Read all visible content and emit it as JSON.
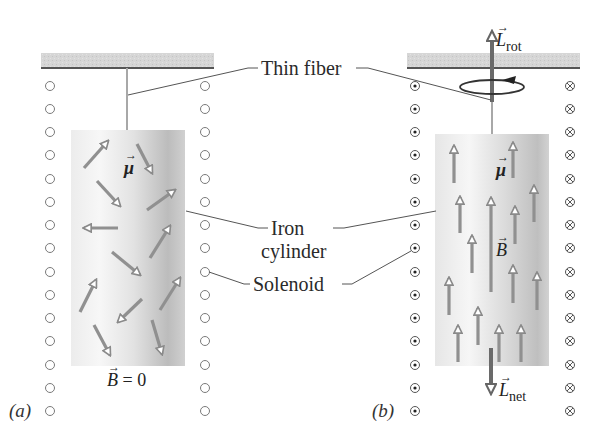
{
  "labels": {
    "thin_fiber": "Thin fiber",
    "iron_cylinder_line1": "Iron",
    "iron_cylinder_line2": "cylinder",
    "solenoid": "Solenoid"
  },
  "panel_a": {
    "tag": "(a)",
    "field_label": "B = 0",
    "field_symbol": "B",
    "field_value": "= 0",
    "moment_symbol": "μ",
    "coil_symbol_left": "○",
    "coil_symbol_right": "○",
    "coil_count": 9
  },
  "panel_b": {
    "tag": "(b)",
    "moment_symbol": "μ",
    "field_symbol": "B",
    "l_rot_symbol": "L",
    "l_rot_sub": "rot",
    "l_net_symbol": "L",
    "l_net_sub": "net",
    "coil_symbol_left": "⊙ (current out of page)",
    "coil_symbol_right": "⊗ (current into page)",
    "coil_count": 9
  },
  "colors": {
    "ceiling_fill": "#d4d4d4",
    "ceiling_line": "#555555",
    "arrow_gray": "#8f8f8f",
    "arrow_dark": "#6a6a6a",
    "cylinder_light": "#f4f4f4",
    "cylinder_dark": "#bdbdbd",
    "leader_line": "#555555",
    "coil_stroke": "#777777"
  }
}
